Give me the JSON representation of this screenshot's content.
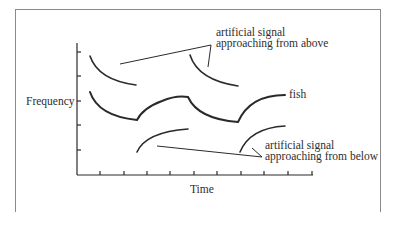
{
  "figure": {
    "type": "diagram",
    "y_axis_label": "Frequency",
    "x_axis_label": "Time",
    "annotations": {
      "above_line1": "artificial signal",
      "above_line2": "approaching from above",
      "fish": "fish",
      "below_line1": "artificial signal",
      "below_line2": "approaching from below"
    },
    "y_ticks": 5,
    "x_ticks": 10,
    "colors": {
      "line": "#2a2a2a",
      "frame": "#8a8a8a",
      "background": "#ffffff"
    }
  }
}
